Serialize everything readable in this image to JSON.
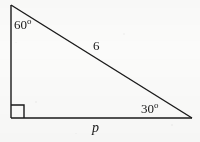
{
  "figure": {
    "type": "right-triangle-diagram",
    "background_color": "#fbfbfa",
    "stroke_color": "#1a1a1a",
    "vertices": {
      "top": [
        11,
        5
      ],
      "bottom_left": [
        11,
        118
      ],
      "bottom_right": [
        192,
        118
      ]
    },
    "right_angle_marker": {
      "at": "bottom_left",
      "size": 13
    },
    "labels": {
      "angle_top": {
        "value": "60",
        "degree_symbol": "o"
      },
      "angle_right": {
        "value": "30",
        "degree_symbol": "o"
      },
      "side_hypotenuse": "6",
      "side_base": "p"
    }
  }
}
